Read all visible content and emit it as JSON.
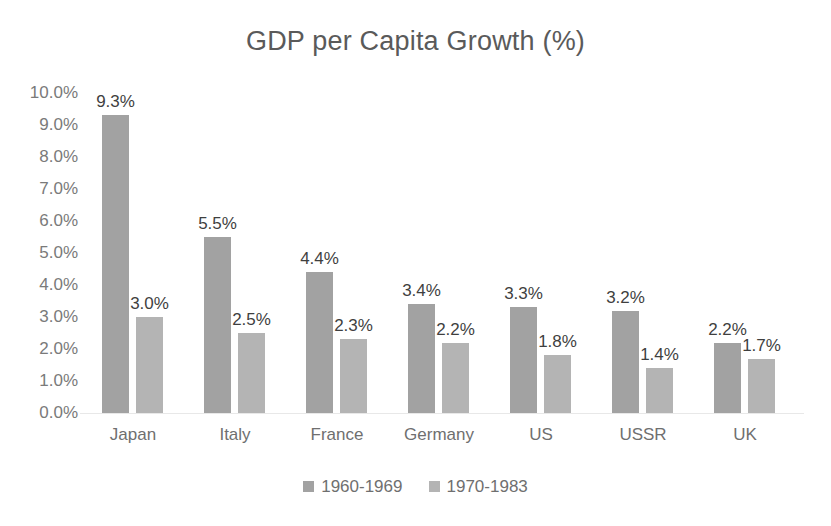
{
  "chart_data": {
    "type": "bar",
    "title": "GDP per Capita Growth (%)",
    "xlabel": "",
    "ylabel": "",
    "ylim": [
      0,
      10
    ],
    "ytick_step": 1,
    "ytick_labels": [
      "10.0%",
      "9.0%",
      "8.0%",
      "7.0%",
      "6.0%",
      "5.0%",
      "4.0%",
      "3.0%",
      "2.0%",
      "1.0%",
      "0.0%"
    ],
    "grid": false,
    "legend_position": "bottom",
    "categories": [
      "Japan",
      "Italy",
      "France",
      "Germany",
      "US",
      "USSR",
      "UK"
    ],
    "series": [
      {
        "name": "1960-1969",
        "color": "#a2a2a2",
        "values": [
          9.3,
          5.5,
          4.4,
          3.4,
          3.3,
          3.2,
          2.2
        ],
        "labels": [
          "9.3%",
          "5.5%",
          "4.4%",
          "3.4%",
          "3.3%",
          "3.2%",
          "2.2%"
        ]
      },
      {
        "name": "1970-1983",
        "color": "#b4b4b4",
        "values": [
          3.0,
          2.5,
          2.3,
          2.2,
          1.8,
          1.4,
          1.7
        ],
        "labels": [
          "3.0%",
          "2.5%",
          "2.3%",
          "2.2%",
          "1.8%",
          "1.4%",
          "1.7%"
        ]
      }
    ]
  },
  "colors": {
    "title": "#5a5a5a",
    "axis_text": "#7a7a7a",
    "data_label": "#3f3f3f",
    "series_1": "#a2a2a2",
    "series_2": "#b4b4b4",
    "background": "#ffffff"
  }
}
